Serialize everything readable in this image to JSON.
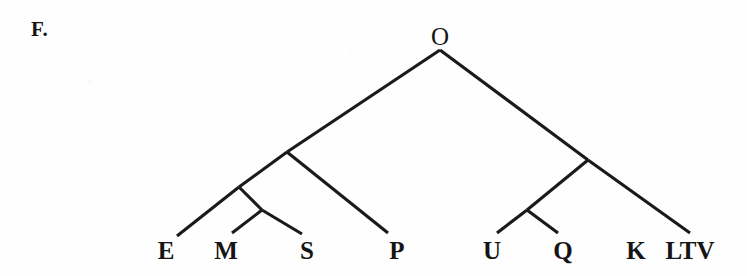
{
  "figure": {
    "label": "F.",
    "type": "cladogram",
    "background_color": "#fefefe",
    "line_color": "#1a1a1a",
    "text_color": "#151515"
  },
  "root": {
    "name": "O",
    "x": 440,
    "y": 36
  },
  "leaves": [
    {
      "id": "E",
      "label": "E",
      "x": 166,
      "y": 259,
      "tip_x": 177,
      "tip_y": 236
    },
    {
      "id": "M",
      "label": "M",
      "x": 226,
      "y": 259,
      "tip_x": 232,
      "tip_y": 233
    },
    {
      "id": "S",
      "label": "S",
      "x": 307,
      "y": 259,
      "tip_x": 302,
      "tip_y": 234
    },
    {
      "id": "P",
      "label": "P",
      "x": 397,
      "y": 259,
      "tip_x": 388,
      "tip_y": 233
    },
    {
      "id": "U",
      "label": "U",
      "x": 492,
      "y": 259,
      "tip_x": 497,
      "tip_y": 233
    },
    {
      "id": "Q",
      "label": "Q",
      "x": 563,
      "y": 259,
      "tip_x": 558,
      "tip_y": 233
    },
    {
      "id": "K",
      "label": "K",
      "x": 636,
      "y": 259,
      "tip_x": 636,
      "tip_y": 259
    },
    {
      "id": "LTV",
      "label": "LTV",
      "x": 690,
      "y": 259,
      "tip_x": 690,
      "tip_y": 233
    }
  ],
  "internal_nodes": [
    {
      "id": "N-root",
      "x": 440,
      "y": 50,
      "children": [
        "N-left",
        "N-right"
      ]
    },
    {
      "id": "N-left",
      "x": 287,
      "y": 152,
      "children": [
        "N-ems",
        "P"
      ]
    },
    {
      "id": "N-ems",
      "x": 239,
      "y": 187,
      "children": [
        "E",
        "N-ms"
      ]
    },
    {
      "id": "N-ms",
      "x": 262,
      "y": 210,
      "children": [
        "M",
        "S"
      ]
    },
    {
      "id": "N-right",
      "x": 588,
      "y": 160,
      "children": [
        "N-uq",
        "LTV"
      ]
    },
    {
      "id": "N-uq",
      "x": 527,
      "y": 210,
      "children": [
        "U",
        "Q"
      ]
    }
  ],
  "branches": [
    {
      "id": "root-to-left",
      "x1": 440,
      "y1": 50,
      "x2": 287,
      "y2": 152
    },
    {
      "id": "root-to-right",
      "x1": 440,
      "y1": 50,
      "x2": 588,
      "y2": 160
    },
    {
      "id": "left-to-ems",
      "x1": 287,
      "y1": 152,
      "x2": 239,
      "y2": 187
    },
    {
      "id": "left-to-P",
      "x1": 287,
      "y1": 152,
      "x2": 388,
      "y2": 233
    },
    {
      "id": "ems-to-E",
      "x1": 239,
      "y1": 187,
      "x2": 177,
      "y2": 236
    },
    {
      "id": "ems-to-ms",
      "x1": 239,
      "y1": 187,
      "x2": 262,
      "y2": 210
    },
    {
      "id": "ms-to-M",
      "x1": 262,
      "y1": 210,
      "x2": 232,
      "y2": 233
    },
    {
      "id": "ms-to-S",
      "x1": 262,
      "y1": 210,
      "x2": 302,
      "y2": 234
    },
    {
      "id": "right-to-uq",
      "x1": 588,
      "y1": 160,
      "x2": 527,
      "y2": 210
    },
    {
      "id": "right-to-LTV",
      "x1": 588,
      "y1": 160,
      "x2": 690,
      "y2": 233
    },
    {
      "id": "uq-to-U",
      "x1": 527,
      "y1": 210,
      "x2": 497,
      "y2": 233
    },
    {
      "id": "uq-to-Q",
      "x1": 527,
      "y1": 210,
      "x2": 558,
      "y2": 233
    }
  ]
}
